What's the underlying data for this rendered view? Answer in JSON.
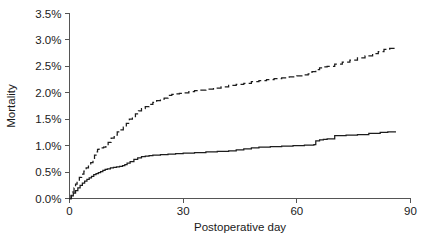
{
  "chart_data": {
    "type": "line",
    "title": "",
    "subtitle": "",
    "xlabel": "Postoperative day",
    "ylabel": "Mortality",
    "xlim": [
      0,
      90
    ],
    "ylim": [
      0,
      3.5
    ],
    "grid": false,
    "legend": "none",
    "xticks": [
      0,
      30,
      60,
      90
    ],
    "xticklabels": [
      "0",
      "30",
      "60",
      "90"
    ],
    "yticks": [
      0.0,
      0.5,
      1.0,
      1.5,
      2.0,
      2.5,
      3.0,
      3.5
    ],
    "yticklabels": [
      "0.0%",
      "0.5%",
      "1.0%",
      "1.5%",
      "2.0%",
      "2.5%",
      "3.0%",
      "3.5%"
    ],
    "y_unit": "%",
    "series": [
      {
        "name": "upper-curve",
        "style": "dashed",
        "color": "#1c1c1c",
        "x": [
          0,
          0.4,
          0.8,
          1.2,
          1.6,
          2.0,
          2.6,
          3.2,
          3.8,
          4.4,
          5.0,
          5.6,
          6.2,
          6.6,
          7.0,
          7.4,
          7.8,
          8.4,
          9.0,
          9.6,
          10.2,
          11.0,
          11.8,
          12.6,
          13.4,
          14.2,
          15.0,
          15.8,
          16.6,
          17.4,
          18.2,
          19.0,
          20.0,
          21.0,
          22.0,
          23.0,
          24.0,
          25.0,
          26.0,
          27.0,
          28.0,
          29.0,
          30.0,
          31.5,
          33.0,
          34.5,
          36.0,
          38.0,
          40.0,
          42.0,
          44.0,
          46.0,
          48.0,
          50.0,
          52.0,
          54.0,
          56.0,
          58.0,
          60.0,
          61.5,
          63.0,
          64.0,
          65.0,
          66.0,
          67.0,
          68.0,
          70.0,
          72.0,
          74.0,
          76.0,
          78.0,
          80.0,
          81.5,
          83.0,
          84.5,
          86.0
        ],
        "y": [
          0.0,
          0.06,
          0.12,
          0.2,
          0.27,
          0.33,
          0.4,
          0.46,
          0.52,
          0.58,
          0.63,
          0.68,
          0.73,
          0.82,
          0.88,
          0.93,
          0.95,
          0.96,
          0.97,
          1.0,
          1.06,
          1.14,
          1.2,
          1.26,
          1.3,
          1.35,
          1.42,
          1.5,
          1.55,
          1.6,
          1.66,
          1.7,
          1.74,
          1.78,
          1.82,
          1.85,
          1.88,
          1.9,
          1.95,
          1.97,
          1.98,
          1.99,
          2.0,
          2.02,
          2.04,
          2.05,
          2.07,
          2.09,
          2.11,
          2.14,
          2.16,
          2.18,
          2.21,
          2.23,
          2.25,
          2.27,
          2.28,
          2.3,
          2.32,
          2.34,
          2.36,
          2.4,
          2.44,
          2.47,
          2.49,
          2.5,
          2.54,
          2.58,
          2.62,
          2.66,
          2.7,
          2.74,
          2.78,
          2.82,
          2.84,
          2.85
        ],
        "end_value": 2.85
      },
      {
        "name": "lower-curve",
        "style": "solid",
        "color": "#1c1c1c",
        "x": [
          0,
          0.5,
          1.0,
          1.6,
          2.2,
          2.8,
          3.4,
          4.0,
          4.6,
          5.2,
          5.8,
          6.4,
          7.0,
          7.6,
          8.2,
          8.8,
          9.4,
          10.0,
          10.8,
          11.6,
          12.4,
          13.2,
          14.0,
          14.6,
          15.2,
          16.0,
          17.0,
          18.0,
          19.0,
          20.0,
          21.0,
          22.0,
          24.0,
          26.0,
          28.0,
          30.0,
          33.0,
          36.0,
          39.0,
          42.0,
          44.0,
          46.0,
          48.0,
          50.0,
          53.0,
          56.0,
          59.0,
          62.0,
          64.5,
          65.0,
          66.0,
          67.0,
          68.0,
          70.0,
          73.0,
          76.0,
          79.0,
          82.0,
          84.0,
          86.0
        ],
        "y": [
          0.0,
          0.05,
          0.1,
          0.15,
          0.2,
          0.25,
          0.29,
          0.33,
          0.36,
          0.39,
          0.42,
          0.45,
          0.47,
          0.49,
          0.51,
          0.53,
          0.55,
          0.56,
          0.58,
          0.59,
          0.6,
          0.61,
          0.62,
          0.64,
          0.67,
          0.7,
          0.74,
          0.77,
          0.79,
          0.8,
          0.81,
          0.82,
          0.83,
          0.84,
          0.85,
          0.86,
          0.87,
          0.88,
          0.89,
          0.9,
          0.92,
          0.94,
          0.96,
          0.97,
          0.98,
          0.99,
          1.0,
          1.01,
          1.02,
          1.09,
          1.11,
          1.12,
          1.13,
          1.19,
          1.2,
          1.21,
          1.23,
          1.25,
          1.26,
          1.27
        ],
        "end_value": 1.27
      }
    ]
  },
  "axes": {
    "y_title": "Mortality",
    "x_title": "Postoperative day"
  }
}
